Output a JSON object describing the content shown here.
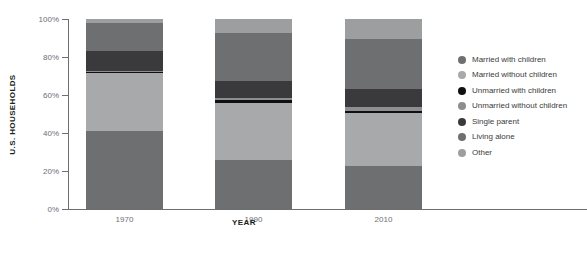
{
  "chart_data": {
    "type": "bar",
    "stacked": true,
    "stacked_mode": "percent",
    "title": "",
    "xlabel": "YEAR",
    "ylabel": "U.S. HOUSEHOLDS",
    "categories": [
      "1970",
      "1990",
      "2010"
    ],
    "ylim": [
      0,
      100
    ],
    "ytick_labels": [
      "0%",
      "20%",
      "40%",
      "60%",
      "80%",
      "100%"
    ],
    "ytick_values": [
      0,
      20,
      40,
      60,
      80,
      100
    ],
    "grid": false,
    "legend_position": "right",
    "series": [
      {
        "name": "Married with children",
        "color": "#6e6f71",
        "values": [
          41.0,
          26.0,
          22.5
        ]
      },
      {
        "name": "Married without children",
        "color": "#a8a9ab",
        "values": [
          30.5,
          30.0,
          28.0
        ]
      },
      {
        "name": "Unmarried with children",
        "color": "#101010",
        "values": [
          0.6,
          1.2,
          1.2
        ]
      },
      {
        "name": "Unmarried without children",
        "color": "#8d8e90",
        "values": [
          0.5,
          1.3,
          2.0
        ]
      },
      {
        "name": "Single parent",
        "color": "#3a3a3c",
        "values": [
          10.4,
          9.0,
          9.3
        ]
      },
      {
        "name": "Living alone",
        "color": "#6e6f71",
        "values": [
          15.0,
          25.0,
          26.5
        ]
      },
      {
        "name": "Other",
        "color": "#9d9ea0",
        "values": [
          2.0,
          7.5,
          10.5
        ]
      }
    ]
  },
  "legend": {
    "items": [
      {
        "label": "Married with children",
        "dot_color": "#6e6f71"
      },
      {
        "label": "Married without children",
        "dot_color": "#a8a9ab"
      },
      {
        "label": "Unmarried with children",
        "dot_color": "#101010"
      },
      {
        "label": "Unmarried without children",
        "dot_color": "#8d8e90"
      },
      {
        "label": "Single parent",
        "dot_color": "#3a3a3c"
      },
      {
        "label": "Living alone",
        "dot_color": "#6e6f71"
      },
      {
        "label": "Other",
        "dot_color": "#9d9ea0"
      }
    ]
  },
  "axes": {
    "y_title": "U.S. HOUSEHOLDS",
    "x_title": "YEAR"
  },
  "colors": {
    "axis": "#6d6e71",
    "tick_text": "#6d6e71",
    "title_text": "#231f20",
    "legend_text": "#3b3b3b",
    "background": "#ffffff"
  }
}
